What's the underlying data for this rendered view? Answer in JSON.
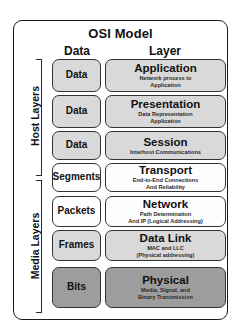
{
  "diagram": {
    "title": "OSI Model",
    "columns": {
      "data_header": "Data",
      "layer_header": "Layer"
    },
    "groups": [
      {
        "id": "host",
        "label": "Host Layers"
      },
      {
        "id": "media",
        "label": "Media Layers"
      }
    ],
    "rows": [
      {
        "group": "host",
        "data_unit": "Data",
        "data_fill": "#d9d9d9",
        "layer_name": "Application",
        "layer_desc_line1": "Network process to",
        "layer_desc_line2": "Application",
        "layer_fill": "#d9d9d9"
      },
      {
        "group": "host",
        "data_unit": "Data",
        "data_fill": "#d9d9d9",
        "layer_name": "Presentation",
        "layer_desc_line1": "Data Representation",
        "layer_desc_line2": "Application",
        "layer_fill": "#d9d9d9"
      },
      {
        "group": "host",
        "data_unit": "Data",
        "data_fill": "#d9d9d9",
        "layer_name": "Session",
        "layer_desc_line1": "Interhost Communications",
        "layer_desc_line2": "",
        "layer_fill": "#d9d9d9"
      },
      {
        "group": "host",
        "data_unit": "Segments",
        "data_fill": "#fdfdfd",
        "layer_name": "Transport",
        "layer_desc_line1": "End-to-End Connections",
        "layer_desc_line2": "And Reliability",
        "layer_fill": "#fdfdfd"
      },
      {
        "group": "media",
        "data_unit": "Packets",
        "data_fill": "#fdfdfd",
        "layer_name": "Network",
        "layer_desc_line1": "Path Determination",
        "layer_desc_line2": "And IP (Logical Addressing)",
        "layer_fill": "#fdfdfd"
      },
      {
        "group": "media",
        "data_unit": "Frames",
        "data_fill": "#d9d9d9",
        "layer_name": "Data Link",
        "layer_desc_line1": "MAC and LLC",
        "layer_desc_line2": "(Physical addressing)",
        "layer_fill": "#d9d9d9"
      },
      {
        "group": "media",
        "data_unit": "Bits",
        "data_fill": "#9d9d9d",
        "layer_name": "Physical",
        "layer_desc_line1": "Media, Signal, and",
        "layer_desc_line2": "Binary Transmission",
        "layer_fill": "#9d9d9d"
      }
    ]
  }
}
